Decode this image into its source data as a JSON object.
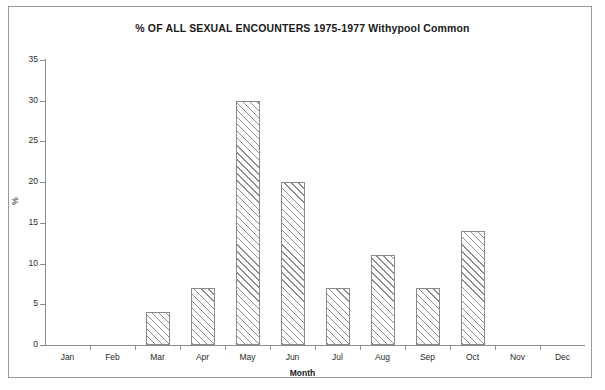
{
  "chart_data": {
    "type": "bar",
    "title": "% OF ALL SEXUAL ENCOUNTERS 1975-1977 Withypool Common",
    "xlabel": "Month",
    "ylabel": "%",
    "categories": [
      "Jan",
      "Feb",
      "Mar",
      "Apr",
      "May",
      "Jun",
      "Jul",
      "Aug",
      "Sep",
      "Oct",
      "Nov",
      "Dec"
    ],
    "values": [
      0,
      0,
      4,
      7,
      30,
      20,
      7,
      11,
      7,
      14,
      0,
      0
    ],
    "ylim": [
      0,
      35
    ],
    "ytick_values": [
      0,
      5,
      10,
      15,
      20,
      25,
      30,
      35
    ],
    "ytick_labels": [
      "0",
      "5",
      "10",
      "15",
      "20",
      "25",
      "30",
      "35"
    ],
    "grid": false,
    "legend": false,
    "bar_style": {
      "fill": "#ffffff",
      "hatch": "diagonal",
      "hatch_color": "#8d8d8d",
      "edge_color": "#8a8a8a"
    },
    "axis_color": "#8d8d8d",
    "text_color": "#2b2b2b",
    "background": "#ffffff",
    "frame_color": "#9a9a9a"
  }
}
